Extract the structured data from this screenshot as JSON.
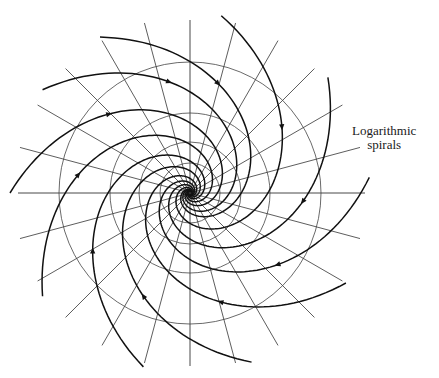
{
  "figure": {
    "label_line1": "Logarithmic",
    "label_line2": "spirals",
    "caption_fragment": "",
    "center": [
      190,
      193
    ],
    "circle_radii": [
      131,
      80,
      51,
      30
    ],
    "radial_line_count": 12,
    "radial_line_length": 176,
    "axis": {
      "horizontal": [
        18,
        365
      ],
      "vertical": [
        20,
        366
      ]
    },
    "spirals": {
      "count": 10,
      "start_radius": 180,
      "pitch_b": 0.6,
      "start_angles_deg": [
        -120,
        -80,
        -40,
        -5,
        30,
        70,
        105,
        145,
        180,
        215
      ],
      "arrow_radius": 112,
      "direction": "inward"
    },
    "colors": {
      "line": "#333333",
      "spiral": "#111111",
      "circle": "#444444"
    }
  }
}
